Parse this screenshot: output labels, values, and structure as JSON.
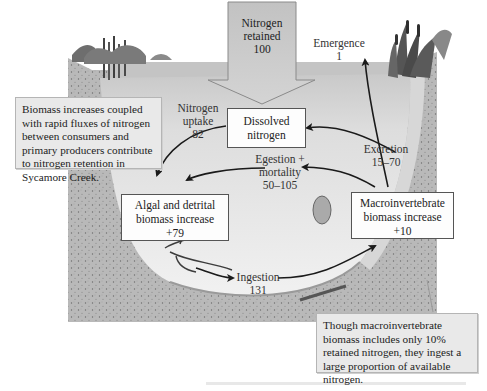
{
  "diagram": {
    "type": "nitrogen-flow-cycle",
    "units_note": "relative units, retained nitrogen = 100",
    "inflow": {
      "label_line1": "Nitrogen",
      "label_line2": "retained",
      "value": "100"
    },
    "nodes": {
      "dissolved": {
        "line1": "Dissolved",
        "line2": "nitrogen"
      },
      "algal": {
        "line1": "Algal and detrital",
        "line2": "biomass increase",
        "value": "+79"
      },
      "macro": {
        "line1": "Macroinvertebrate",
        "line2": "biomass increase",
        "value": "+10"
      }
    },
    "fluxes": {
      "uptake": {
        "line1": "Nitrogen",
        "line2": "uptake",
        "value": "82"
      },
      "egestion": {
        "line1": "Egestion +",
        "line2": "mortality",
        "value": "50–105"
      },
      "ingestion": {
        "line1": "Ingestion",
        "value": "131"
      },
      "excretion": {
        "line1": "Excretion",
        "value": "15–70"
      },
      "emergence": {
        "line1": "Emergence",
        "value": "1"
      }
    },
    "notes": {
      "left": "Biomass increases coupled with rapid fluxes of nitrogen between consumers and primary producers contribute to nitrogen retention in Sycamore Creek.",
      "bottom": "Though macroinvertebrate biomass includes only 10% retained nitrogen, they ingest a large proportion of available nitrogen."
    },
    "colors": {
      "arrow_fill": "#c8c8c8",
      "arrow_stroke": "#8a8a8a",
      "water": "#dcdcdc",
      "sediment": "#b4b4b4",
      "note_bg": "#e9e9e9",
      "flux_arrow": "#1a1a1a"
    }
  }
}
